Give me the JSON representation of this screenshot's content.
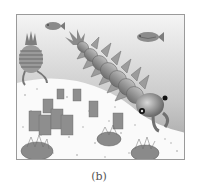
{
  "figure": {
    "caption": "(b)",
    "colors": {
      "water_top": "#f2f2f2",
      "water_bottom": "#a8a8a8",
      "seafloor": "#fafafa",
      "border": "#9a9a9a",
      "creature": "#8a8a8a",
      "creature_dark": "#5e5e5e",
      "eye": "#111111"
    },
    "elements": [
      {
        "name": "anomalocaris",
        "label": "large segmented predator"
      },
      {
        "name": "fish-left",
        "label": "small fish"
      },
      {
        "name": "fish-right",
        "label": "small fish"
      },
      {
        "name": "striped-creature",
        "label": "striped swimming creature"
      },
      {
        "name": "sponges",
        "label": "sponge cluster"
      },
      {
        "name": "trilobite-creatures",
        "label": "fringed seafloor creatures"
      }
    ]
  }
}
